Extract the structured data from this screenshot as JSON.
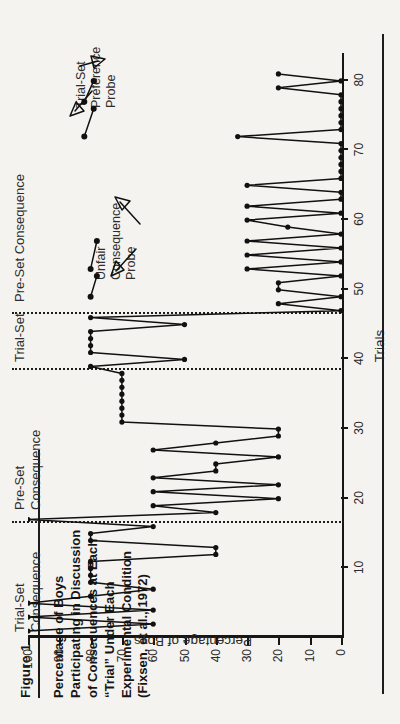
{
  "figure": {
    "label": "Figure 1",
    "caption": "Percentage of Boys\nParticipating in Discussion\nof Consequences at Each\n“Trial” Under Each\nExperimental Condition\n(Fixsen, et al., 1972)"
  },
  "annotations": [
    {
      "name": "trial-set-preference-probe",
      "text": "Trial-Set\nPreference\nProbe"
    },
    {
      "name": "unfair-consequence-probe",
      "text": "Unfair\nConsequence\nProbe"
    }
  ],
  "phases": [
    {
      "name": "phase-trial-set-consequence",
      "text": "Trial-Set\nConsequence"
    },
    {
      "name": "phase-pre-set-consequence-1",
      "text": "Pre-Set\nConsequence"
    },
    {
      "name": "phase-trial-set",
      "text": "Trial-Set"
    },
    {
      "name": "phase-pre-set-consequence-2",
      "text": "Pre-Set Consequence"
    }
  ],
  "chart_data": {
    "type": "line",
    "title": "Percentage of Boys Participating in Discussion of Consequences at Each “Trial” Under Each Experimental Condition (Fixsen, et al., 1972)",
    "xlabel": "Trials",
    "ylabel": "Percentage of Boys",
    "xlim": [
      0,
      84
    ],
    "ylim": [
      0,
      100
    ],
    "xticks": [
      10,
      20,
      30,
      40,
      50,
      60,
      70,
      80
    ],
    "yticks": [
      0,
      10,
      20,
      30,
      40,
      50,
      60,
      70,
      80,
      90,
      100
    ],
    "grid": false,
    "legend": "none",
    "phase_boundaries": [
      16.5,
      38.5,
      46.5
    ],
    "phase_labels": [
      "Trial-Set Consequence",
      "Pre-Set Consequence",
      "Trial-Set",
      "Pre-Set Consequence"
    ],
    "series": [
      {
        "name": "Percentage of Boys",
        "x": [
          1,
          2,
          3,
          4,
          5,
          6,
          7,
          8,
          9,
          10,
          11,
          12,
          13,
          14,
          15,
          16,
          17,
          18,
          19,
          20,
          21,
          22,
          23,
          24,
          25,
          26,
          27,
          28,
          29,
          30,
          31,
          32,
          33,
          34,
          35,
          36,
          37,
          38,
          39,
          40,
          41,
          42,
          43,
          44,
          45,
          46,
          47,
          48,
          49,
          50,
          51,
          52,
          53,
          54,
          55,
          56,
          57,
          58,
          59,
          60,
          61,
          62,
          63,
          64,
          65,
          66,
          67,
          68,
          69,
          70,
          71,
          72,
          73,
          74,
          75,
          76,
          77,
          78,
          79,
          80,
          81
        ],
        "values": [
          100,
          60,
          100,
          60,
          100,
          80,
          60,
          80,
          80,
          80,
          80,
          40,
          40,
          80,
          80,
          60,
          100,
          40,
          60,
          20,
          60,
          20,
          60,
          40,
          40,
          20,
          60,
          40,
          20,
          20,
          70,
          70,
          70,
          70,
          70,
          70,
          70,
          70,
          80,
          50,
          80,
          80,
          80,
          80,
          50,
          80,
          0,
          20,
          0,
          20,
          20,
          0,
          30,
          0,
          30,
          0,
          30,
          0,
          17,
          30,
          0,
          30,
          0,
          0,
          30,
          0,
          0,
          0,
          0,
          0,
          0,
          33,
          0,
          0,
          0,
          0,
          0,
          0,
          20,
          0,
          20
        ]
      }
    ],
    "probe_segments": [
      {
        "name": "unfair-consequence-probe-left",
        "x": [
          49,
          52
        ],
        "values": [
          80,
          78
        ]
      },
      {
        "name": "unfair-consequence-probe-right",
        "x": [
          53,
          57
        ],
        "values": [
          80,
          78
        ]
      },
      {
        "name": "trial-set-preference-probe-left",
        "x": [
          72,
          76
        ],
        "values": [
          82,
          79
        ]
      },
      {
        "name": "trial-set-preference-probe-right",
        "x": [
          77,
          80
        ],
        "values": [
          82,
          79
        ]
      }
    ]
  }
}
